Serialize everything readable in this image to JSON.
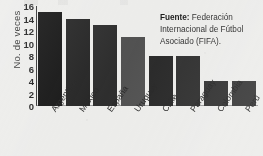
{
  "chart_data": {
    "type": "bar",
    "title": "",
    "xlabel": "",
    "ylabel": "No. de veces",
    "categories": [
      "Argentina",
      "México",
      "España",
      "Uruguay",
      "Chile",
      "Paraguay",
      "Colombia",
      "Perú"
    ],
    "values": [
      15,
      14,
      13,
      11,
      8,
      8,
      4,
      4
    ],
    "bar_colors": [
      "#0b0b0b",
      "#1c1c1c",
      "#242424",
      "#4a4a4a",
      "#1f1f1f",
      "#272727",
      "#2b2b2b",
      "#333333"
    ],
    "ylim": [
      0,
      16
    ],
    "ytick_labels": [
      "16",
      "14",
      "12",
      "10",
      "8",
      "6",
      "4",
      "2",
      "0"
    ],
    "ytick_values": [
      16,
      14,
      12,
      10,
      8,
      6,
      4,
      2,
      0
    ],
    "grid": false,
    "legend": "none",
    "annotations": {
      "source_label": "Fuente:",
      "source_text": " Federación Internacional de Fútbol Asociado (FIFA)."
    }
  },
  "colors": {
    "background": "#ececea",
    "axis": "#2c2c2c",
    "text": "#1e1e1e"
  }
}
